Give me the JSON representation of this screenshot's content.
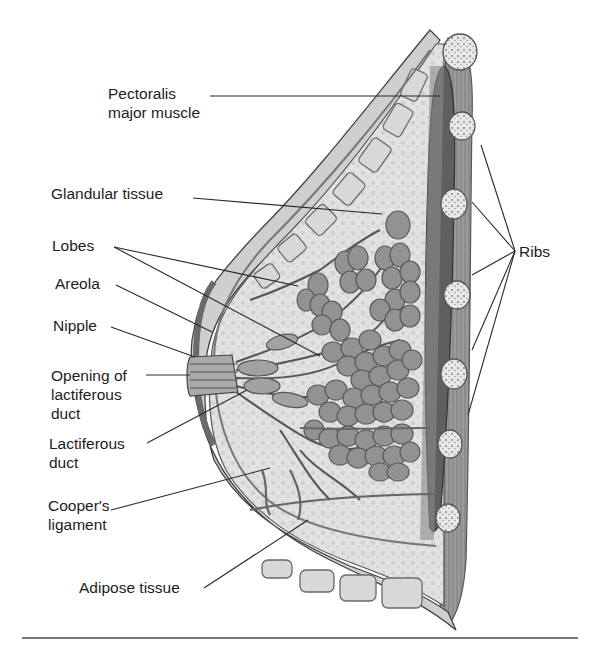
{
  "figure": {
    "labels": {
      "pectoralis": [
        "Pectoralis",
        "major muscle"
      ],
      "glandular": [
        "Glandular tissue"
      ],
      "lobes": [
        "Lobes"
      ],
      "areola": [
        "Areola"
      ],
      "nipple": [
        "Nipple"
      ],
      "opening": [
        "Opening of",
        "lactiferous",
        "duct"
      ],
      "lactiferous": [
        "Lactiferous",
        "duct"
      ],
      "cooper": [
        "Cooper's",
        "ligament"
      ],
      "adipose": [
        "Adipose tissue"
      ],
      "ribs": [
        "Ribs"
      ]
    },
    "colors": {
      "line": "#2a2a2a",
      "tissue_light": "#e6e6e6",
      "tissue_mid": "#bdbdbd",
      "lobule": "#8f8f8f",
      "muscle_dark": "#5a5a5a",
      "rule": "#7a7a7a"
    }
  }
}
